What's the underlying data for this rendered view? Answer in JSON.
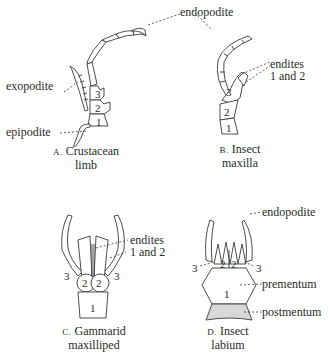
{
  "figures": {
    "A": {
      "caption_letter": "A.",
      "caption_line1": "Crustacean",
      "caption_line2": "limb",
      "labels": {
        "endopodite": "endopodite",
        "exopodite": "exopodite",
        "epipodite": "epipodite"
      },
      "segments": [
        "1",
        "2",
        "3"
      ]
    },
    "B": {
      "caption_letter": "B.",
      "caption_line1": "Insect",
      "caption_line2": "maxilla",
      "labels": {
        "endites_line1": "endites",
        "endites_line2": "1 and 2"
      },
      "segments": [
        "1",
        "2",
        "3"
      ]
    },
    "C": {
      "caption_letter": "C.",
      "caption_line1": "Gammarid",
      "caption_line2": "maxilliped",
      "labels": {
        "endites_line1": "endites",
        "endites_line2": "1 and 2"
      },
      "segments": [
        "1",
        "2",
        "2",
        "3",
        "3"
      ]
    },
    "D": {
      "caption_letter": "D.",
      "caption_line1": "Insect",
      "caption_line2": "labium",
      "labels": {
        "endopodite": "endopodite",
        "prementum": "prementum",
        "postmentum": "postmentum"
      },
      "segments": [
        "1",
        "2",
        "2",
        "3",
        "3"
      ]
    }
  }
}
